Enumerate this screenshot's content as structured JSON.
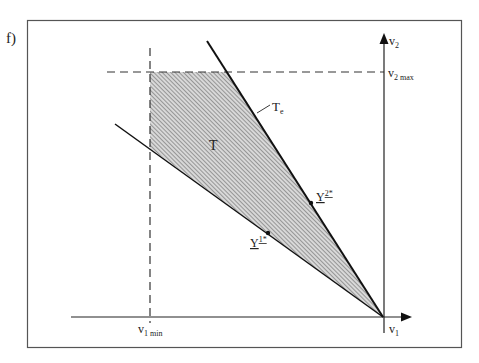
{
  "panel": {
    "label": "f)"
  },
  "axes": {
    "x_label": "v",
    "x_label_sub": "1",
    "y_label": "v",
    "y_label_sub": "2",
    "x_min_label": "v",
    "x_min_sub": "1 min",
    "y_max_label": "v",
    "y_max_sub": "2 max"
  },
  "region": {
    "label": "T"
  },
  "efficient_frontier": {
    "label": "T",
    "label_sub": "e"
  },
  "points": [
    {
      "label": "Y",
      "sup": "1*"
    },
    {
      "label": "Y",
      "sup": "2*"
    }
  ],
  "colors": {
    "frame": "#555555",
    "lines": "#1a1a1a",
    "hatch": "#888888",
    "dash": "#333333"
  }
}
